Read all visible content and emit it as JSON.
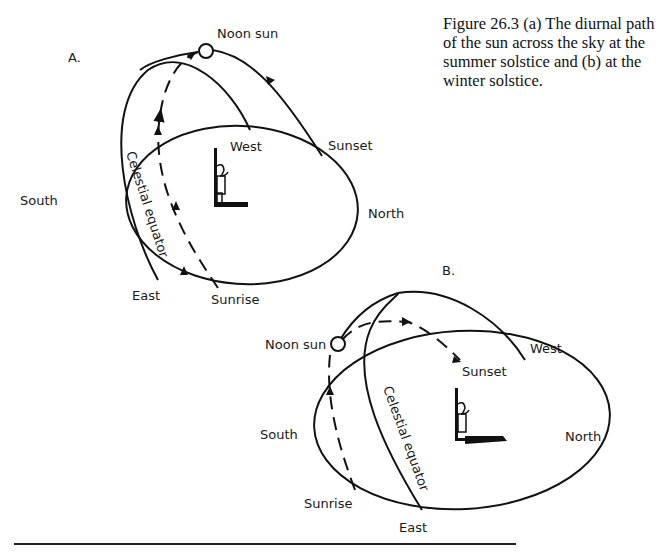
{
  "caption": "Figure 26.3  (a) The diurnal path of the sun across the sky at the summer solstice and  (b) at the winter solstice.",
  "panel_a": {
    "label": "A.",
    "noon_sun": "Noon sun",
    "west": "West",
    "sunset": "Sunset",
    "south": "South",
    "north": "North",
    "east": "East",
    "sunrise": "Sunrise",
    "celestial_equator": "Celestial equator"
  },
  "panel_b": {
    "label": "B.",
    "noon_sun": "Noon sun",
    "west": "West",
    "sunset": "Sunset",
    "south": "South",
    "north": "North",
    "east": "East",
    "sunrise": "Sunrise",
    "celestial_equator": "Celestial equator"
  }
}
